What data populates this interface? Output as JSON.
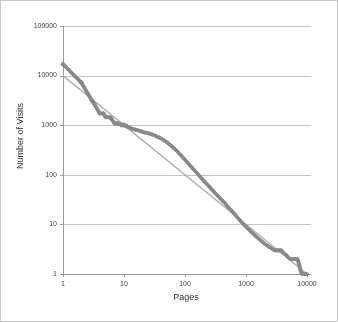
{
  "figure": {
    "background_color": "#ffffff",
    "border_color": "#c9c9c9"
  },
  "chart_data": {
    "type": "scatter",
    "title": "",
    "xlabel": "Pages",
    "ylabel": "Number of Visits",
    "xscale": "log",
    "yscale": "log",
    "xlim": [
      1,
      10000
    ],
    "ylim": [
      1,
      100000
    ],
    "grid": "horizontal",
    "legend": "none",
    "xticks": [
      "1",
      "10",
      "100",
      "1000",
      "10000"
    ],
    "xtick_values": [
      1,
      10,
      100,
      1000,
      10000
    ],
    "yticks": [
      "1",
      "10",
      "100",
      "1000",
      "10000",
      "100000"
    ],
    "ytick_values": [
      1,
      10,
      100,
      1000,
      10000,
      100000
    ],
    "series": [
      {
        "name": "Visits per page rank",
        "marker": "diamond",
        "color": "#8a8a8a",
        "points": [
          [
            1,
            17000
          ],
          [
            2,
            7200
          ],
          [
            3,
            3100
          ],
          [
            4,
            1750
          ],
          [
            4.6,
            1700
          ],
          [
            5,
            1480
          ],
          [
            6,
            1420
          ],
          [
            7,
            1100
          ],
          [
            8,
            1080
          ],
          [
            9,
            1020
          ],
          [
            10,
            1000
          ],
          [
            11,
            960
          ],
          [
            12,
            900
          ],
          [
            13,
            870
          ],
          [
            14,
            840
          ],
          [
            15,
            820
          ],
          [
            16,
            800
          ],
          [
            18,
            770
          ],
          [
            20,
            740
          ],
          [
            22,
            710
          ],
          [
            25,
            690
          ],
          [
            28,
            660
          ],
          [
            30,
            640
          ],
          [
            33,
            610
          ],
          [
            36,
            580
          ],
          [
            40,
            545
          ],
          [
            45,
            500
          ],
          [
            50,
            455
          ],
          [
            55,
            415
          ],
          [
            60,
            380
          ],
          [
            65,
            350
          ],
          [
            70,
            320
          ],
          [
            75,
            295
          ],
          [
            80,
            272
          ],
          [
            90,
            232
          ],
          [
            100,
            200
          ],
          [
            110,
            176
          ],
          [
            120,
            156
          ],
          [
            130,
            140
          ],
          [
            140,
            126
          ],
          [
            150,
            115
          ],
          [
            170,
            97
          ],
          [
            190,
            83
          ],
          [
            210,
            72
          ],
          [
            240,
            61
          ],
          [
            270,
            52
          ],
          [
            300,
            45
          ],
          [
            350,
            37
          ],
          [
            400,
            31
          ],
          [
            450,
            27
          ],
          [
            500,
            23
          ],
          [
            600,
            18
          ],
          [
            700,
            14.5
          ],
          [
            800,
            12
          ],
          [
            900,
            10.2
          ],
          [
            1000,
            9
          ],
          [
            1200,
            7.2
          ],
          [
            1400,
            6
          ],
          [
            1600,
            5.2
          ],
          [
            1800,
            4.6
          ],
          [
            2000,
            4.1
          ],
          [
            2400,
            3.5
          ],
          [
            2800,
            3.1
          ],
          [
            3000,
            3.0
          ],
          [
            3400,
            3.0
          ],
          [
            3800,
            3.0
          ],
          [
            4200,
            2.6
          ],
          [
            4600,
            2.4
          ],
          [
            5000,
            2.1
          ],
          [
            5400,
            2.0
          ],
          [
            5800,
            2.0
          ],
          [
            6200,
            2.0
          ],
          [
            6600,
            2.0
          ],
          [
            7000,
            2.0
          ],
          [
            7400,
            1.6
          ],
          [
            7800,
            1.2
          ],
          [
            8200,
            1.0
          ],
          [
            8600,
            1.0
          ],
          [
            9000,
            1.0
          ],
          [
            9400,
            1.0
          ],
          [
            9700,
            1.0
          ],
          [
            10000,
            1.0
          ]
        ]
      }
    ],
    "trendline": {
      "name": "power-law fit",
      "color": "#b0b0b0",
      "start": [
        1,
        10000
      ],
      "end": [
        10000,
        1
      ]
    }
  }
}
